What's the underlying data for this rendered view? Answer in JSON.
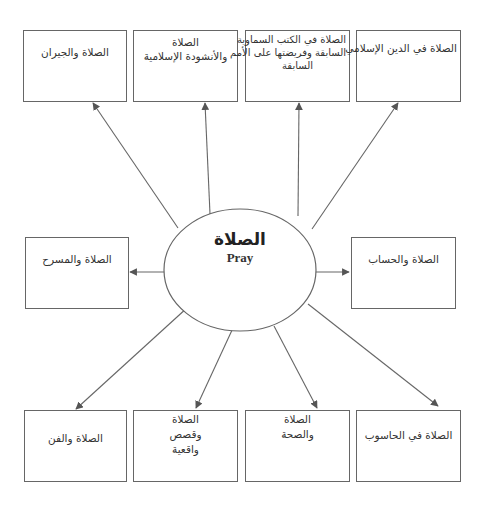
{
  "center": {
    "arabic": "الصلاة",
    "english": "Pray"
  },
  "boxes": {
    "top_1": {
      "lines": [
        "الصلاة والجيران"
      ]
    },
    "top_2": {
      "lines": [
        "الصلاة",
        "والأنشودة الإسلامية"
      ]
    },
    "top_3": {
      "lines": [
        "الصلاة في الكتب السماوية",
        "السابقة وفريضتها على الأمم",
        "السابقة"
      ]
    },
    "top_4": {
      "lines": [
        "الصلاة في الدين الإسلامي"
      ]
    },
    "mid_left": {
      "lines": [
        "الصلاة والمسرح"
      ]
    },
    "mid_right": {
      "lines": [
        "الصلاة والحساب"
      ]
    },
    "bottom_1": {
      "lines": [
        "الصلاة والفن"
      ]
    },
    "bottom_2": {
      "lines": [
        "الصلاة",
        "وقصص",
        "واقعية"
      ]
    },
    "bottom_3": {
      "lines": [
        "الصلاة",
        "والصحة"
      ]
    },
    "bottom_4": {
      "lines": [
        "الصلاة في الحاسوب"
      ]
    }
  },
  "colors": {
    "stroke": "#666666",
    "text": "#333333",
    "background": "#ffffff"
  }
}
